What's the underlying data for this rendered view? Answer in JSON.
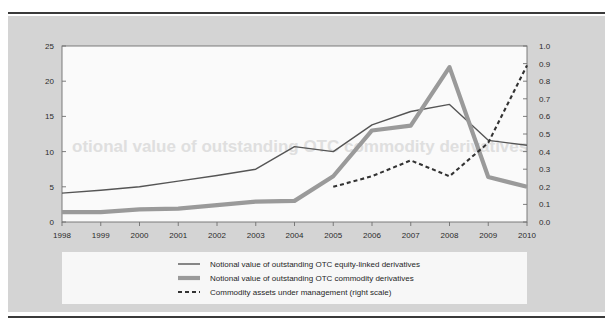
{
  "figure": {
    "background_color": "#ffffff",
    "panel_color": "#d4d4d4",
    "plot_color": "#fafafa",
    "rule_color": "#3a3a3a"
  },
  "colors": {
    "equity_linked": "#555555",
    "commodity": "#9a9a9a",
    "commodity_aum": "#333333",
    "axis": "#707070",
    "text": "#2b2b2b"
  },
  "watermark": {
    "text": "otional value of outstanding OTC commodity derivatives"
  },
  "legend": {
    "position": "bottom",
    "items": [
      {
        "label": "Notional value of outstanding OTC equity-linked derivatives",
        "style": "solid-thin",
        "color": "#555555"
      },
      {
        "label": "Notional value of outstanding OTC commodity derivatives",
        "style": "solid-thick",
        "color": "#9a9a9a"
      },
      {
        "label": "Commodity assets under management (right scale)",
        "style": "dashed",
        "color": "#333333"
      }
    ]
  },
  "chart_data": {
    "type": "line",
    "title": "",
    "xlabel": "",
    "ylabel": "",
    "grid": false,
    "categories": [
      "1998",
      "1999",
      "2000",
      "2001",
      "2002",
      "2003",
      "2004",
      "2005",
      "2006",
      "2007",
      "2008",
      "2009",
      "2010"
    ],
    "x_tick_labels": [
      "1998",
      "1999",
      "2000",
      "2001",
      "2002",
      "2003",
      "2004",
      "2005",
      "2006",
      "2007",
      "2008",
      "2009",
      "2010"
    ],
    "left_axis": {
      "ylim": [
        0,
        25
      ],
      "ticks": [
        0,
        5,
        10,
        15,
        20,
        25
      ],
      "tick_labels": [
        "0",
        "5",
        "10",
        "15",
        "20",
        "25"
      ]
    },
    "right_axis": {
      "ylim": [
        0.0,
        1.0
      ],
      "ticks": [
        0.0,
        0.1,
        0.2,
        0.3,
        0.4,
        0.5,
        0.6,
        0.7,
        0.8,
        0.9,
        1.0
      ],
      "tick_labels": [
        "0.0",
        "0.1",
        "0.2",
        "0.3",
        "0.4",
        "0.5",
        "0.6",
        "0.7",
        "0.8",
        "0.9",
        "1.0"
      ]
    },
    "series": [
      {
        "name": "Notional value of outstanding OTC equity-linked derivatives",
        "axis": "left",
        "style": "solid-thin",
        "color": "#555555",
        "x": [
          "1998",
          "1999",
          "2000",
          "2001",
          "2002",
          "2003",
          "2004",
          "2005",
          "2006",
          "2007",
          "2008",
          "2009",
          "2010"
        ],
        "values": [
          4.1,
          4.5,
          5.0,
          5.8,
          6.6,
          7.5,
          10.7,
          10.0,
          13.8,
          15.7,
          16.7,
          11.6,
          10.9
        ]
      },
      {
        "name": "Notional value of outstanding OTC commodity derivatives",
        "axis": "left",
        "style": "solid-thick",
        "color": "#9a9a9a",
        "x": [
          "1998",
          "1999",
          "2000",
          "2001",
          "2002",
          "2003",
          "2004",
          "2005",
          "2006",
          "2007",
          "2008",
          "2009",
          "2010"
        ],
        "values": [
          1.4,
          1.4,
          1.8,
          1.9,
          2.4,
          2.9,
          3.0,
          6.5,
          13.0,
          13.7,
          22.0,
          6.4,
          5.0
        ]
      },
      {
        "name": "Commodity assets under management (right scale)",
        "axis": "right",
        "style": "dashed",
        "color": "#333333",
        "x": [
          "2005",
          "2006",
          "2007",
          "2008",
          "2009",
          "2010"
        ],
        "values": [
          0.2,
          0.26,
          0.35,
          0.26,
          0.45,
          0.89
        ]
      }
    ]
  }
}
